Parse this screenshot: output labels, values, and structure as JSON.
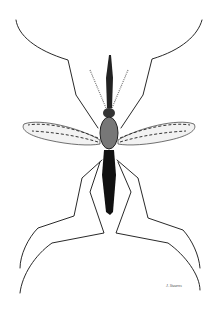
{
  "image": {
    "subject": "Mosquito scientific illustration (dorsal view)",
    "colors": {
      "background": "#ffffff",
      "ink": "#111111",
      "wing": "#555555"
    },
    "signature_text": "J. Stearns"
  }
}
